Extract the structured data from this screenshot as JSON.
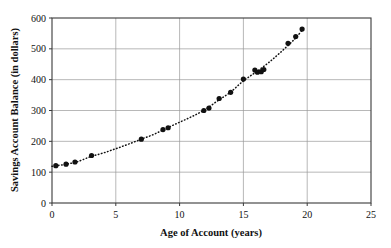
{
  "chart_data": {
    "type": "scatter",
    "title": "",
    "xlabel": "Age of Account (years)",
    "ylabel": "Savings Account Balance (in dollars)",
    "xlim": [
      0,
      25
    ],
    "ylim": [
      0,
      600
    ],
    "xticks": [
      0,
      5,
      10,
      15,
      20,
      25
    ],
    "yticks": [
      0,
      100,
      200,
      300,
      400,
      500,
      600
    ],
    "xtick_labels": [
      "0",
      "5",
      "10",
      "15",
      "20",
      "25"
    ],
    "ytick_labels": [
      "0",
      "100",
      "200",
      "300",
      "400",
      "500",
      "600"
    ],
    "grid": true,
    "legend": "none",
    "marker": "filled-circle",
    "marker_color": "#111111",
    "trend_line": {
      "style": "dotted",
      "color": "#111111",
      "description": "dotted exponential growth curve through the points"
    },
    "points": [
      {
        "x": 0.3,
        "y": 121
      },
      {
        "x": 1.1,
        "y": 126
      },
      {
        "x": 1.8,
        "y": 133
      },
      {
        "x": 3.1,
        "y": 154
      },
      {
        "x": 7.0,
        "y": 207
      },
      {
        "x": 8.7,
        "y": 238
      },
      {
        "x": 9.1,
        "y": 244
      },
      {
        "x": 11.9,
        "y": 300
      },
      {
        "x": 12.3,
        "y": 308
      },
      {
        "x": 13.1,
        "y": 339
      },
      {
        "x": 14.0,
        "y": 359
      },
      {
        "x": 15.0,
        "y": 402
      },
      {
        "x": 15.9,
        "y": 431
      },
      {
        "x": 16.1,
        "y": 424
      },
      {
        "x": 16.4,
        "y": 426
      },
      {
        "x": 16.6,
        "y": 433
      },
      {
        "x": 18.5,
        "y": 518
      },
      {
        "x": 19.1,
        "y": 540
      },
      {
        "x": 19.6,
        "y": 564
      }
    ],
    "curve_points": [
      {
        "x": 0.0,
        "y": 119
      },
      {
        "x": 1.0,
        "y": 125
      },
      {
        "x": 2.0,
        "y": 134
      },
      {
        "x": 3.0,
        "y": 150
      },
      {
        "x": 4.0,
        "y": 162
      },
      {
        "x": 5.0,
        "y": 176
      },
      {
        "x": 6.0,
        "y": 191
      },
      {
        "x": 7.0,
        "y": 207
      },
      {
        "x": 8.0,
        "y": 223
      },
      {
        "x": 9.0,
        "y": 243
      },
      {
        "x": 10.0,
        "y": 262
      },
      {
        "x": 11.0,
        "y": 281
      },
      {
        "x": 12.0,
        "y": 303
      },
      {
        "x": 13.0,
        "y": 332
      },
      {
        "x": 14.0,
        "y": 360
      },
      {
        "x": 15.0,
        "y": 396
      },
      {
        "x": 16.0,
        "y": 425
      },
      {
        "x": 17.0,
        "y": 456
      },
      {
        "x": 18.0,
        "y": 492
      },
      {
        "x": 19.0,
        "y": 531
      },
      {
        "x": 19.6,
        "y": 560
      }
    ]
  },
  "axes": {
    "x_title": "Age of Account (years)",
    "y_title": "Savings Account Balance (in dollars)"
  }
}
